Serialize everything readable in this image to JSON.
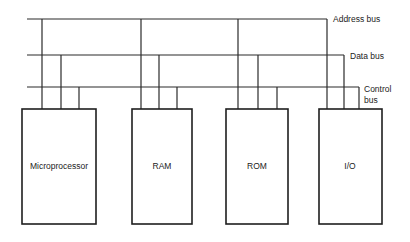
{
  "diagram": {
    "buses": [
      {
        "name": "Address bus",
        "label_lines": [
          "Address bus"
        ],
        "y": 19,
        "x_start": 27,
        "x_end": 327
      },
      {
        "name": "Data bus",
        "label_lines": [
          "Data bus"
        ],
        "y": 55,
        "x_start": 27,
        "x_end": 344
      },
      {
        "name": "Control bus",
        "label_lines": [
          "Control",
          "bus"
        ],
        "y": 87,
        "x_start": 27,
        "x_end": 359
      }
    ],
    "components": [
      {
        "name": "Microprocessor",
        "x": 22,
        "y": 109,
        "w": 74,
        "h": 115,
        "taps": [
          42,
          61,
          79
        ]
      },
      {
        "name": "RAM",
        "x": 132,
        "y": 109,
        "w": 60,
        "h": 115,
        "taps": [
          141,
          159,
          177
        ]
      },
      {
        "name": "ROM",
        "x": 226,
        "y": 109,
        "w": 62,
        "h": 115,
        "taps": [
          238,
          258,
          277
        ]
      },
      {
        "name": "I/O",
        "x": 319,
        "y": 109,
        "w": 63,
        "h": 115,
        "taps": [
          327,
          344,
          359
        ]
      }
    ],
    "labels": {
      "address_bus": "Address bus",
      "data_bus": "Data bus",
      "control_bus_line1": "Control",
      "control_bus_line2": "bus",
      "microprocessor": "Microprocessor",
      "ram": "RAM",
      "rom": "ROM",
      "io": "I/O"
    }
  }
}
